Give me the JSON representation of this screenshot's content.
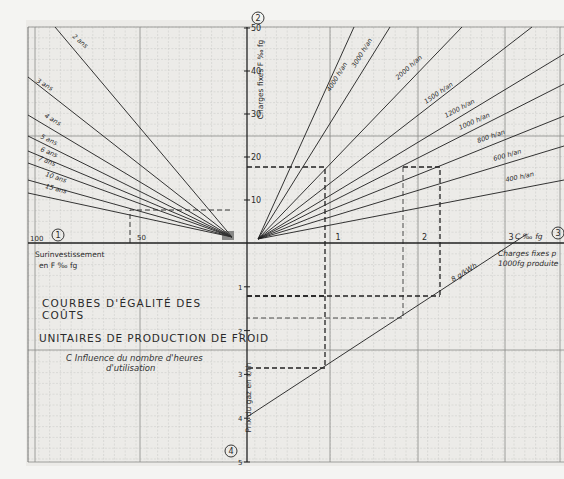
{
  "title": {
    "line1": "COURBES D'ÉGALITÉ DES COÛTS",
    "line2": "UNITAIRES DE PRODUCTION DE FROID",
    "subtitle1": "C Influence du nombre d'heures",
    "subtitle2": "d'utilisation"
  },
  "quadrant_markers": [
    "1",
    "2",
    "3",
    "4"
  ],
  "axes": {
    "upper": {
      "label": "Charges fixes F ‰ fg",
      "ticks": [
        "10",
        "20",
        "30",
        "40",
        "50"
      ]
    },
    "left": {
      "label_line1": "Surinvestissement",
      "label_line2": "en F ‰ fg",
      "ticks": [
        "100",
        "50"
      ]
    },
    "right": {
      "label_unit": "C ‰ fg",
      "label_line1": "Charges fixes p",
      "label_line2": "1000fg produite",
      "ticks": [
        "1",
        "2",
        "3"
      ]
    },
    "lower": {
      "label": "Prix du gaz en c/th",
      "ticks": [
        "1",
        "2",
        "3",
        "4",
        "5"
      ]
    }
  },
  "colors": {
    "paper": "#f2f2f0",
    "grid_minor": "#c9c9c6",
    "grid_major": "#8a8a88",
    "ink": "#2a2a2a"
  },
  "chart_data": {
    "type": "nomogram",
    "quadrant_1_amortization_lines": {
      "description": "Lines from origin to left: surinvestissement (F‰fg) vs charges fixes (F‰fg), one per amortization period",
      "series": [
        {
          "name": "2 ans",
          "slope_charges_per_surinv": 0.5
        },
        {
          "name": "3 ans",
          "slope_charges_per_surinv": 0.333
        },
        {
          "name": "4 ans",
          "slope_charges_per_surinv": 0.25
        },
        {
          "name": "5 ans",
          "slope_charges_per_surinv": 0.2
        },
        {
          "name": "6 ans",
          "slope_charges_per_surinv": 0.167
        },
        {
          "name": "7 ans",
          "slope_charges_per_surinv": 0.143
        },
        {
          "name": "10 ans",
          "slope_charges_per_surinv": 0.1
        },
        {
          "name": "15 ans",
          "slope_charges_per_surinv": 0.067
        }
      ]
    },
    "quadrant_2_utilisation_lines": {
      "description": "Lines from origin to right: charges fixes per 1000 fg produite (C‰fg) vs charges fixes (F‰fg), one per annual operating hours",
      "series": [
        {
          "name": "4000 h/an"
        },
        {
          "name": "3000 h/an"
        },
        {
          "name": "2000 h/an"
        },
        {
          "name": "1500 h/an"
        },
        {
          "name": "1200 h/an"
        },
        {
          "name": "1000 h/an"
        },
        {
          "name": "800 h/an"
        },
        {
          "name": "600 h/an"
        },
        {
          "name": "400 h/an"
        }
      ]
    },
    "quadrant_3_price_line": {
      "name": "8 g/kWh",
      "description": "Line linking gas price (c/th) to fixed charges per 1000 fg",
      "points": [
        {
          "c_per_fg": 0,
          "gas_price": 3.95
        },
        {
          "c_per_fg": 3.2,
          "gas_price": 0
        }
      ]
    },
    "example_paths": [
      {
        "surinvestissement": 55,
        "charges_fixes": 8,
        "c_per_fg": 0.95,
        "gas_price": 2.85
      },
      {
        "charges_fixes": 17.5,
        "c_per_fg": 0.95,
        "gas_price": 1.1
      },
      {
        "charges_fixes": 17.5,
        "c_per_fg": 2.0,
        "gas_price": 1.1
      },
      {
        "c_per_fg": 1.85,
        "gas_price": 1.6
      }
    ],
    "xlabel_left": "Surinvestissement en F ‰ fg",
    "xlabel_right": "Charges fixes p. 1000 fg produite C ‰ fg",
    "ylabel_upper": "Charges fixes F ‰ fg",
    "ylabel_lower": "Prix du gaz en c/th",
    "x_left_range": [
      0,
      100
    ],
    "x_right_range": [
      0,
      3.5
    ],
    "y_upper_range": [
      0,
      50
    ],
    "y_lower_range": [
      0,
      5
    ],
    "grid": true
  },
  "line_labels": {
    "years": [
      "2 ans",
      "3 ans",
      "4 ans",
      "5 ans",
      "6 ans",
      "7 ans",
      "10 ans",
      "15 ans"
    ],
    "hours": [
      "4000 h/an",
      "3000 h/an",
      "2000 h/an",
      "1500 h/an",
      "1200 h/an",
      "1000 h/an",
      "800 h/an",
      "600 h/an",
      "400 h/an"
    ],
    "price": "8 g/kWh"
  }
}
